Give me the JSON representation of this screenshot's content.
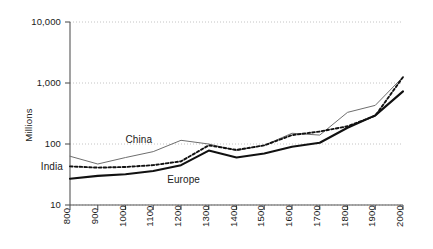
{
  "chart_data": {
    "type": "line",
    "title": "",
    "subtitle": "",
    "xlabel": "",
    "ylabel": "Millions",
    "yscale": "log",
    "ylim": [
      10,
      10000
    ],
    "xlim": [
      800,
      2000
    ],
    "grid": true,
    "grid_axis": "y",
    "legend_position": "inline-annotations",
    "x": [
      800,
      900,
      1000,
      1100,
      1200,
      1300,
      1400,
      1500,
      1600,
      1700,
      1800,
      1900,
      2000
    ],
    "ytick_labels": [
      "10",
      "100",
      "1,000",
      "10,000"
    ],
    "ytick_values": [
      10,
      100,
      1000,
      10000
    ],
    "xtick_labels": [
      "800",
      "900",
      "1000",
      "1100",
      "1200",
      "1300",
      "1400",
      "1500",
      "1600",
      "1700",
      "1800",
      "1900",
      "2000"
    ],
    "series": [
      {
        "name": "China",
        "style": "solid-thin",
        "color": "#6e6e6e",
        "label_x": 1000,
        "label_y": 118,
        "values": [
          63,
          47,
          60,
          75,
          115,
          100,
          78,
          95,
          150,
          140,
          330,
          430,
          1260
        ]
      },
      {
        "name": "India",
        "style": "dotted",
        "color": "#111111",
        "label_x": 800,
        "label_y": 43,
        "values": [
          43,
          41,
          42,
          45,
          52,
          95,
          80,
          95,
          140,
          160,
          195,
          290,
          1250
        ]
      },
      {
        "name": "Europe",
        "style": "solid-thick",
        "color": "#111111",
        "label_x": 1150,
        "label_y": 26,
        "values": [
          27,
          30,
          32,
          36,
          45,
          78,
          60,
          70,
          90,
          105,
          185,
          295,
          730
        ]
      }
    ],
    "annotations": [
      {
        "text": "China",
        "series": "China"
      },
      {
        "text": "India",
        "series": "India"
      },
      {
        "text": "Europe",
        "series": "Europe"
      }
    ],
    "colors": {
      "china": "#6e6e6e",
      "india": "#111111",
      "europe": "#111111",
      "axis": "#555555",
      "grid": "#bdbdbd",
      "background": "#ffffff"
    }
  }
}
